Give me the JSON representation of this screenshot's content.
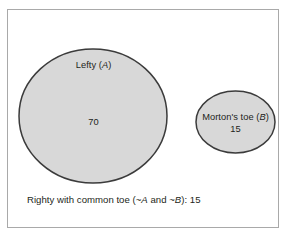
{
  "figure": {
    "type": "venn-diagram-disjoint",
    "background_color": "#ffffff",
    "frame_color": "#a9a9a9",
    "set_fill_color": "#d8d8d8",
    "set_stroke_color": "#3b3b3b",
    "text_color": "#231f20"
  },
  "sets": [
    {
      "key": "A",
      "label_prefix": "Lefty (",
      "label_symbol": "A",
      "label_suffix": ")",
      "label_full": "Lefty (A)",
      "value": "70",
      "shape": "ellipse",
      "cx": 93,
      "cy": 116,
      "rx": 74,
      "ry": 67
    },
    {
      "key": "B",
      "label_prefix": "Morton's toe (",
      "label_symbol": "B",
      "label_suffix": ")",
      "label_full": "Morton's toe (B)",
      "value": "15",
      "shape": "ellipse",
      "cx": 235.5,
      "cy": 122,
      "rx": 39.5,
      "ry": 31
    }
  ],
  "caption": {
    "prefix": "Righty with common toe (~",
    "symbol_a": "A",
    "middle": " and ~",
    "symbol_b": "B",
    "suffix": "): 15",
    "full_text": "Righty with common toe (~A and ~B): 15",
    "value": "15"
  },
  "chart_data": {
    "type": "venn",
    "title": "",
    "sets": [
      "Lefty (A)",
      "Morton's toe (B)"
    ],
    "categories": [
      "Lefty (A)",
      "Morton's toe (B)",
      "Righty with common toe (~A and ~B)"
    ],
    "values": [
      70,
      15,
      15
    ],
    "overlap": 0,
    "total": 100,
    "legend": "none",
    "grid": false
  }
}
